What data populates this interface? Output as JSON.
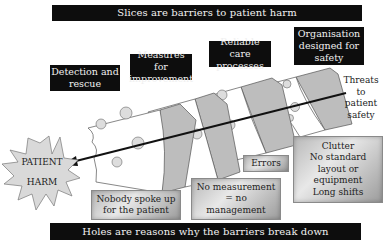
{
  "header": {
    "title": "Slices are barriers to patient harm"
  },
  "footer": {
    "title": "Holes are reasons why the barriers break down"
  },
  "barriers": [
    {
      "label_line1": "Detection and",
      "label_line2": "rescue"
    },
    {
      "label_line1": "Measures for",
      "label_line2": "improvement"
    },
    {
      "label_line1": "Reliable care",
      "label_line2": "processes"
    },
    {
      "label_line1": "Organisation",
      "label_line2": "designed for",
      "label_line3": "safety"
    }
  ],
  "threats": {
    "line1": "Threats",
    "line2": "to",
    "line3": "patient",
    "line4": "safety"
  },
  "outcome": {
    "line1": "PATIENT",
    "line2": "HARM"
  },
  "holes": [
    {
      "line1": "Nobody spoke up",
      "line2": "for the patient"
    },
    {
      "line1": "No measurement",
      "line2": "= no",
      "line3": "management"
    },
    {
      "line1": "Errors"
    },
    {
      "line1": "Clutter",
      "line2": "No standard",
      "line3": "layout or",
      "line4": "equipment",
      "line5": "Long shifts"
    }
  ],
  "colors": {
    "bar_bg": "#0d0d0d",
    "cheese_face": "#ffffff",
    "cheese_side": "#bdbdbd",
    "starburst": "#d9d9d9",
    "hole_box": "#c4c4c4"
  }
}
